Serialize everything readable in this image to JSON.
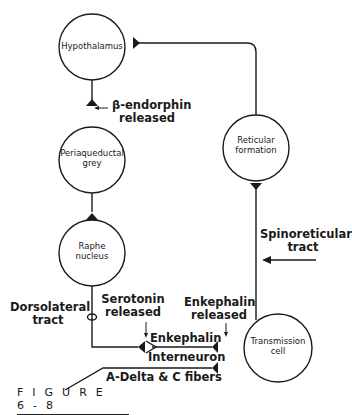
{
  "nodes": {
    "hypothalamus": "Hypothalamus",
    "periaqueductal_line1": "Periaqueductal",
    "periaqueductal_line2": "grey",
    "raphe_line1": "Raphe",
    "raphe_line2": "nucleus",
    "reticular_line1": "Reticular",
    "reticular_line2": "formation",
    "transmission_line1": "Transmission",
    "transmission_line2": "cell"
  },
  "annotations": {
    "beta_endorphin_line1": "β-endorphin",
    "beta_endorphin_line2": "released",
    "spinoreticular_line1": "Spinoreticular",
    "spinoreticular_line2": "tract",
    "dorsolateral_line1": "Dorsolateral",
    "dorsolateral_line2": "tract",
    "serotonin_line1": "Serotonin",
    "serotonin_line2": "released",
    "enkephalin_released_line1": "Enkephalin",
    "enkephalin_released_line2": "released",
    "enkephalin_interneuron_line1": "Enkephalin",
    "enkephalin_interneuron_line2": "Interneuron",
    "fibers": "A-Delta & C fibers"
  },
  "figure_caption": "FIGURE 6-8",
  "colors": {
    "stroke": "#1a1a1a",
    "background": "#ffffff"
  }
}
